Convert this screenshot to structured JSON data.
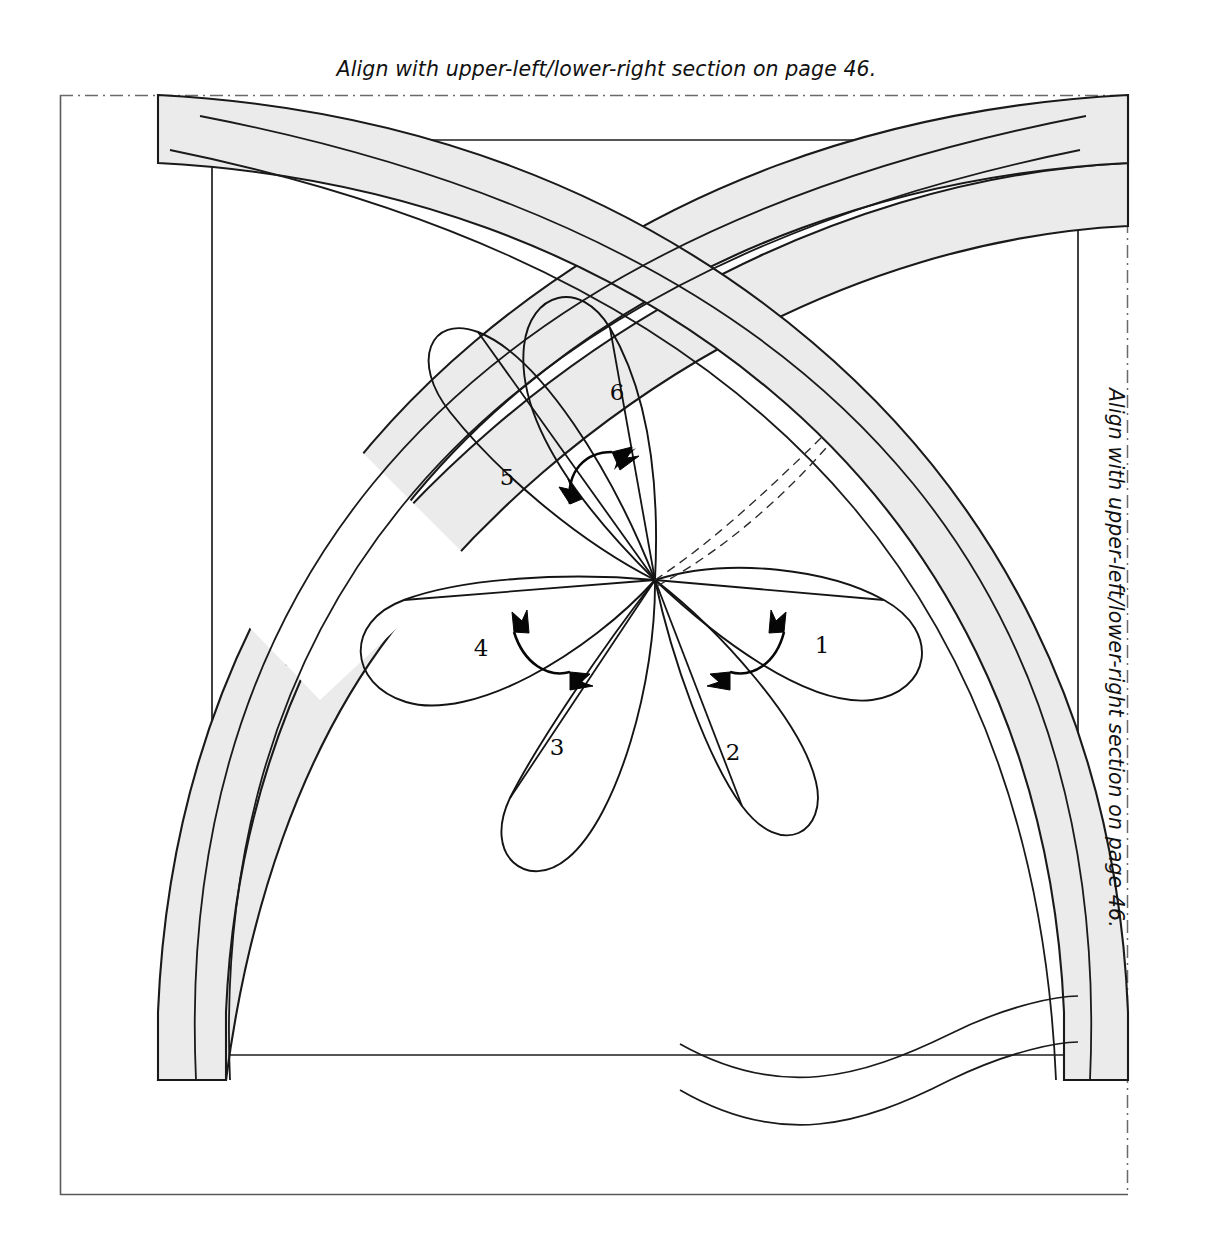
{
  "page": {
    "width": 1213,
    "height": 1259,
    "background": "#ffffff"
  },
  "captions": {
    "top": "Align with upper-left/lower-right section on page 46.",
    "right": "Align with upper-left/lower-right section on page 46."
  },
  "colors": {
    "ink": "#111111",
    "line": "#1a1a1a",
    "band_fill": "#ebebeb",
    "band_stroke": "#1a1a1a",
    "frame_stroke": "#555555",
    "dash_guide": "#2b2b2b",
    "paper": "#ffffff"
  },
  "frame": {
    "label": "pattern-section-frame",
    "x": 60,
    "y": 95,
    "width": 1068,
    "height": 1100,
    "solid_edges": [
      "left",
      "bottom"
    ],
    "dash_dot_edges": [
      "top",
      "right"
    ],
    "inner_rect": {
      "x": 212,
      "y": 140,
      "width": 866,
      "height": 915
    }
  },
  "petals": [
    {
      "id": "petal-1",
      "label": "1",
      "x": 822,
      "y": 645
    },
    {
      "id": "petal-2",
      "label": "2",
      "x": 733,
      "y": 752
    },
    {
      "id": "petal-3",
      "label": "3",
      "x": 557,
      "y": 747
    },
    {
      "id": "petal-4",
      "label": "4",
      "x": 481,
      "y": 648
    },
    {
      "id": "petal-5",
      "label": "5",
      "x": 507,
      "y": 477
    },
    {
      "id": "petal-6",
      "label": "6",
      "x": 617,
      "y": 392
    }
  ],
  "petal_center": {
    "x": 655,
    "y": 580
  },
  "fold_arrows": [
    {
      "id": "fold-arrow-petal-5-6",
      "x": 592,
      "y": 472
    },
    {
      "id": "fold-arrow-petal-3-4",
      "x": 528,
      "y": 652
    },
    {
      "id": "fold-arrow-petal-1-2",
      "x": 766,
      "y": 650
    }
  ],
  "guide_curves": {
    "id": "dashed-placement-guides",
    "count": 2,
    "from": {
      "x": 655,
      "y": 580
    },
    "to": {
      "x": 822,
      "y": 437
    }
  },
  "bands": {
    "id": "interlaced-gray-bands",
    "count": 2,
    "fill": "#ebebeb",
    "description": "two wide arcing bands woven over/under at four crossings"
  }
}
